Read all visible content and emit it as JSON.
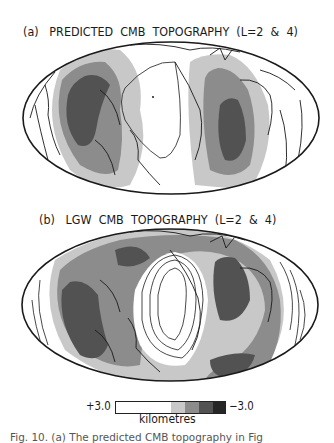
{
  "figure": {
    "panel_a": {
      "label": "(a)",
      "title": "PREDICTED  CMB  TOPOGRAPHY  (L=2  &  4)"
    },
    "panel_b": {
      "label": "(b)",
      "title": "LGW  CMB  TOPOGRAPHY  (L=2  &  4)"
    },
    "projection": "Hammer-Aitoff world map with coastlines",
    "legend": {
      "max_label": "+3.0",
      "min_label": "−3.0",
      "unit": "kilometres",
      "swatches": [
        "#ffffff",
        "#c8c8c8",
        "#8c8c8c",
        "#525252",
        "#262626"
      ]
    },
    "caption": "Fig. 10. (a) The predicted CMB topography in Fig"
  },
  "colors": {
    "ink": "#1a1a1a",
    "level_1": "#ffffff",
    "level_2": "#c8c8c8",
    "level_3": "#8c8c8c",
    "level_4": "#525252",
    "level_5": "#262626"
  }
}
